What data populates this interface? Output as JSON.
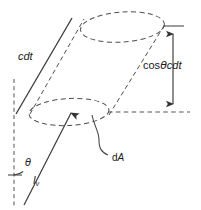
{
  "figure": {
    "name": "radiative-transfer-cylinder-diagram",
    "width": 201,
    "height": 210,
    "background": "#ffffff",
    "stroke_color": "#444444",
    "text_color": "#1a1a1a"
  },
  "labels": {
    "slant_length": "cdt",
    "height": {
      "cos": "cos",
      "theta": "θ",
      "cdt": "cdt",
      "full": "cosθcdt"
    },
    "angle": "θ",
    "intensity": {
      "symbol": "I",
      "subscript": "ν",
      "full": "Iν"
    },
    "area_element": "dA"
  },
  "elements": [
    {
      "name": "top-ellipse",
      "style": "dashed",
      "role": "cylinder top cap"
    },
    {
      "name": "bottom-ellipse",
      "style": "dashed",
      "role": "cylinder bottom cap / area element dA"
    },
    {
      "name": "cylinder-left-edge",
      "style": "solid",
      "role": "slant side labeled cdt"
    },
    {
      "name": "cylinder-left-edge-inner",
      "style": "dashed",
      "role": "hidden slant side"
    },
    {
      "name": "cylinder-right-edge",
      "style": "dashed",
      "role": "far slant side"
    },
    {
      "name": "normal-line",
      "style": "dashed",
      "role": "vertical surface normal"
    },
    {
      "name": "ray-arrow",
      "style": "solid",
      "role": "incident ray Iν"
    },
    {
      "name": "angle-arc",
      "style": "solid",
      "role": "angle θ between normal and ray"
    },
    {
      "name": "height-dimension-arrow",
      "style": "solid double-headed",
      "role": "vertical height cosθcdt"
    },
    {
      "name": "height-baseline",
      "style": "dashed",
      "role": "horizontal projection baseline"
    },
    {
      "name": "height-topline",
      "style": "solid tick",
      "role": "horizontal tick at top of dimension"
    },
    {
      "name": "da-leader",
      "style": "solid curve",
      "role": "leader line to dA label"
    }
  ]
}
